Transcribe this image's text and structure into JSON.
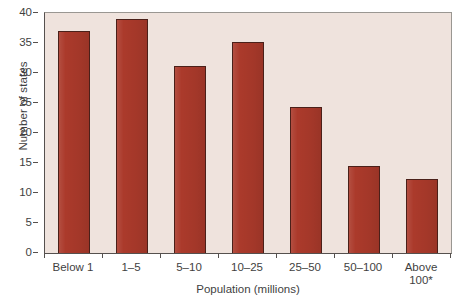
{
  "chart_data": {
    "type": "bar",
    "title": "",
    "xlabel": "Population (millions)",
    "ylabel": "Number of states",
    "categories": [
      "Below 1",
      "1–5",
      "5–10",
      "10–25",
      "25–50",
      "50–100",
      "Above\n100*"
    ],
    "values": [
      37,
      39,
      31.2,
      35.2,
      24.3,
      14.5,
      12.4
    ],
    "ylim": [
      0,
      40
    ],
    "yticks": [
      0,
      5,
      10,
      15,
      20,
      25,
      30,
      35,
      40
    ],
    "ytick_labels": [
      "0",
      "5",
      "10",
      "15",
      "20",
      "25",
      "30",
      "35",
      "40"
    ],
    "grid": false,
    "legend": "none",
    "bar_color": "#ab3a2b",
    "bar_edge_color": "#4a2019",
    "plot_background": "#efe3dd",
    "axis_color": "#55504e",
    "figure_background": "#ffffff"
  }
}
